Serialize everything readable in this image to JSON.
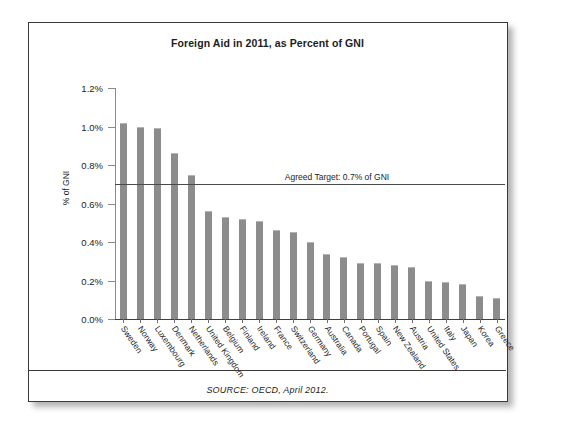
{
  "figure": {
    "source_note": "SOURCE: OECD, April 2012.",
    "bar_color": "#8c8c8c",
    "target_line_color": "#4a4a4a",
    "card_border_color": "#3a3a3a"
  },
  "chart_data": {
    "type": "bar",
    "title": "Foreign Aid in 2011, as Percent of GNI",
    "xlabel": "",
    "ylabel": "% of GNI",
    "ylim": [
      0,
      1.2
    ],
    "ytick_labels": [
      "0.0%",
      "0.2%",
      "0.4%",
      "0.6%",
      "0.8%",
      "1.0%",
      "1.2%"
    ],
    "ytick_values": [
      0.0,
      0.2,
      0.4,
      0.6,
      0.8,
      1.0,
      1.2
    ],
    "grid": false,
    "legend": "none",
    "unit": "percent",
    "categories": [
      "Sweden",
      "Norway",
      "Luxembourg",
      "Denmark",
      "Netherlands",
      "United Kingdom",
      "Belgium",
      "Finland",
      "Ireland",
      "France",
      "Switzerland",
      "Germany",
      "Australia",
      "Canada",
      "Portugal",
      "Spain",
      "New Zealand",
      "Austria",
      "United States",
      "Italy",
      "Japan",
      "Korea",
      "Greece"
    ],
    "values": [
      1.02,
      1.0,
      0.99,
      0.86,
      0.75,
      0.56,
      0.53,
      0.52,
      0.51,
      0.46,
      0.45,
      0.4,
      0.34,
      0.32,
      0.29,
      0.29,
      0.28,
      0.27,
      0.2,
      0.19,
      0.18,
      0.12,
      0.11
    ],
    "annotations": [
      {
        "name": "agreed-target",
        "label": "Agreed Target: 0.7% of GNI",
        "value": 0.7,
        "orientation": "horizontal"
      }
    ]
  }
}
